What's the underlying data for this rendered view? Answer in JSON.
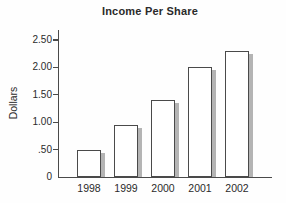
{
  "chart_data": {
    "type": "bar",
    "title": "Income Per Share",
    "ylabel": "Dollars",
    "xlabel": "",
    "categories": [
      "1998",
      "1999",
      "2000",
      "2001",
      "2002"
    ],
    "values": [
      0.5,
      0.95,
      1.4,
      2.0,
      2.3
    ],
    "y_ticks": [
      {
        "value": 0,
        "label": "0"
      },
      {
        "value": 0.5,
        "label": ".50"
      },
      {
        "value": 1.0,
        "label": "1.00"
      },
      {
        "value": 1.5,
        "label": "1.50"
      },
      {
        "value": 2.0,
        "label": "2.00"
      },
      {
        "value": 2.5,
        "label": "2.50"
      }
    ],
    "ylim": [
      0,
      2.68
    ],
    "grid": false,
    "legend": "none",
    "colors": {
      "bar_fill": "#ffffff",
      "bar_border": "#4a4a4a",
      "bar_shadow": "#b4b4b4",
      "axis": "#4a4a4a",
      "text": "#2b2b2b",
      "background": "#fefefe"
    }
  }
}
